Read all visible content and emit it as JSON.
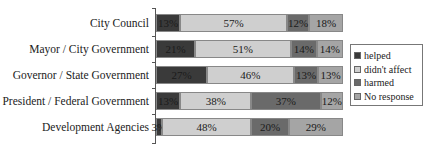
{
  "chart_data": {
    "type": "bar",
    "orientation": "horizontal",
    "stacked": true,
    "percent": true,
    "title": "",
    "xlabel": "",
    "ylabel": "",
    "xlim": [
      0,
      100
    ],
    "grid": false,
    "legend_position": "right",
    "categories": [
      "City Council",
      "Mayor / City Government",
      "Governor / State Government",
      "President / Federal Government",
      "Development Agencies"
    ],
    "series": [
      {
        "name": "helped",
        "color": "#3a3a3a",
        "values": [
          13,
          21,
          27,
          13,
          3
        ]
      },
      {
        "name": "didn't affect",
        "color": "#cfcfcf",
        "values": [
          57,
          51,
          46,
          38,
          48
        ]
      },
      {
        "name": "harmed",
        "color": "#6a6a6a",
        "values": [
          12,
          14,
          13,
          37,
          20
        ]
      },
      {
        "name": "No response",
        "color": "#a5a5a5",
        "values": [
          18,
          14,
          13,
          12,
          29
        ]
      }
    ],
    "data_labels": [
      [
        "13%",
        "57%",
        "12%",
        "18%"
      ],
      [
        "21%",
        "51%",
        "14%",
        "14%"
      ],
      [
        "27%",
        "46%",
        "13%",
        "13%"
      ],
      [
        "13%",
        "38%",
        "37%",
        "12%"
      ],
      [
        "3%",
        "48%",
        "20%",
        "29%"
      ]
    ]
  },
  "legend": {
    "items": [
      {
        "label": "helped",
        "color": "#3a3a3a"
      },
      {
        "label": "didn't affect",
        "color": "#cfcfcf"
      },
      {
        "label": "harmed",
        "color": "#6a6a6a"
      },
      {
        "label": "No response",
        "color": "#a5a5a5"
      }
    ]
  }
}
